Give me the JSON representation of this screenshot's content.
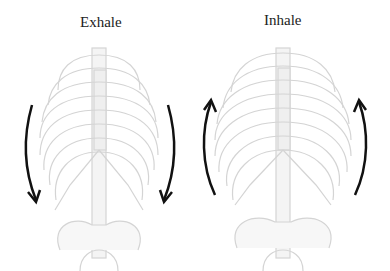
{
  "diagram": {
    "panels": [
      {
        "id": "exhale",
        "title": "Exhale",
        "arrow_direction": "down"
      },
      {
        "id": "inhale",
        "title": "Inhale",
        "arrow_direction": "up"
      }
    ],
    "colors": {
      "bone_outline": "#d4d4d4",
      "bone_fill": "#f4f4f4",
      "arrow": "#111111",
      "text": "#222222"
    }
  }
}
